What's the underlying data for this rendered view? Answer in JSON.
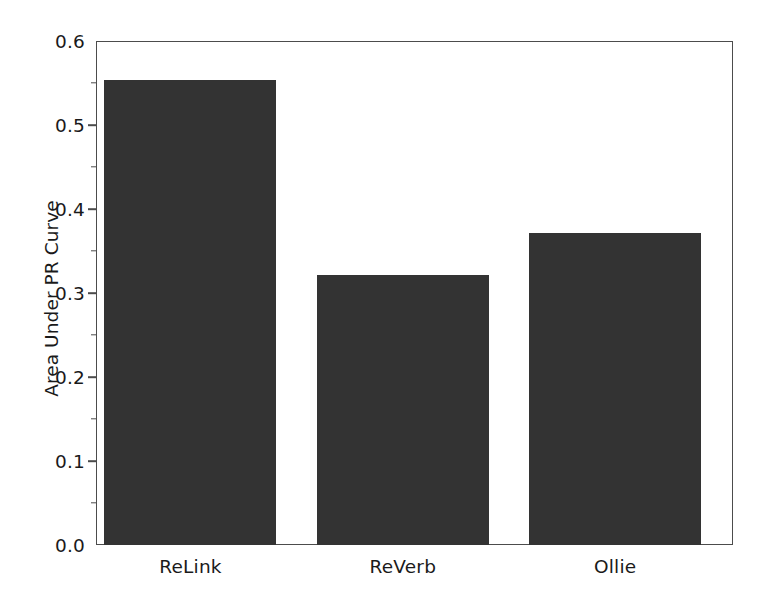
{
  "chart_data": {
    "type": "bar",
    "title": "",
    "xlabel": "",
    "ylabel": "Area Under PR Curve",
    "categories": [
      "ReLink",
      "ReVerb",
      "Ollie"
    ],
    "values": [
      0.553,
      0.321,
      0.372
    ],
    "ylim": [
      0.0,
      0.6
    ],
    "yticks": [
      "0.0",
      "0.1",
      "0.2",
      "0.3",
      "0.4",
      "0.5",
      "0.6"
    ],
    "ytick_values": [
      0.0,
      0.1,
      0.2,
      0.3,
      0.4,
      0.5,
      0.6
    ],
    "yminor_values": [
      0.05,
      0.15,
      0.25,
      0.35,
      0.45,
      0.55
    ],
    "grid": false,
    "legend": "none",
    "bar_color": "#333333",
    "axis_color": "#4c4c4c",
    "background": "#ffffff",
    "text_color": "#1a1a1a"
  }
}
